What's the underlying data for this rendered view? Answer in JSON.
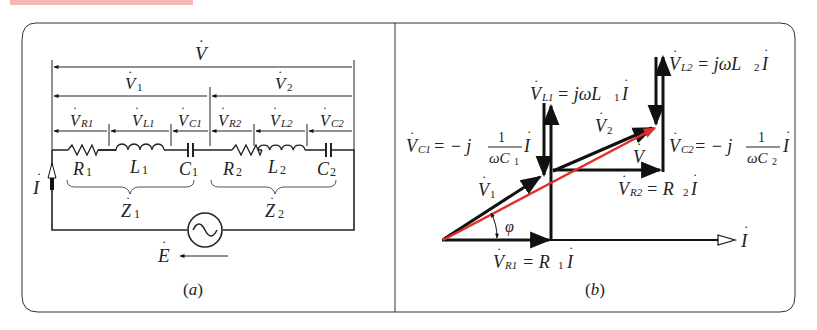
{
  "header_bar": {
    "color": "#f4b8b8"
  },
  "panel_a": {
    "caption": "（a）",
    "caption_letter": "a",
    "labels": {
      "V": "V",
      "V1": "V",
      "V1_sub": "1",
      "V2": "V",
      "V2_sub": "2",
      "VR1": "V",
      "VR1_sub": "R1",
      "VL1": "V",
      "VL1_sub": "L1",
      "VC1": "V",
      "VC1_sub": "C1",
      "VR2": "V",
      "VR2_sub": "R2",
      "VL2": "V",
      "VL2_sub": "L2",
      "VC2": "V",
      "VC2_sub": "C2",
      "R1": "R",
      "R1_sub": "1",
      "L1": "L",
      "L1_sub": "1",
      "C1": "C",
      "C1_sub": "1",
      "R2": "R",
      "R2_sub": "2",
      "L2": "L",
      "L2_sub": "2",
      "C2": "C",
      "C2_sub": "2",
      "Z1": "Z",
      "Z1_sub": "1",
      "Z2": "Z",
      "Z2_sub": "2",
      "I": "I",
      "E": "E"
    }
  },
  "panel_b": {
    "caption": "（b）",
    "caption_letter": "b",
    "labels": {
      "VL2_eq": "= jωL",
      "VL2_name": "V",
      "VL2_sub": "L2",
      "VL2_L_sub": "2",
      "VL2_I": "I",
      "VL1_name": "V",
      "VL1_sub": "L1",
      "VL1_eq": "= jωL",
      "VL1_L_sub": "1",
      "VL1_I": "I",
      "VC1_name": "V",
      "VC1_sub": "C1",
      "VC1_eq": "= − j",
      "VC1_num": "1",
      "VC1_den": "ωC",
      "VC1_den_sub": "1",
      "VC1_I": "I",
      "VC2_name": "V",
      "VC2_sub": "C2",
      "VC2_eq": "= − j",
      "VC2_num": "1",
      "VC2_den": "ωC",
      "VC2_den_sub": "2",
      "VC2_I": "I",
      "V2": "V",
      "V2_sub": "2",
      "V": "V",
      "V1": "V",
      "V1_sub": "1",
      "VR2_name": "V",
      "VR2_sub": "R2",
      "VR2_eq": "= R",
      "VR2_R_sub": "2",
      "VR2_I": "I",
      "VR1_name": "V",
      "VR1_sub": "R1",
      "VR1_eq": "= R",
      "VR1_R_sub": "1",
      "VR1_I": "I",
      "phi": "φ",
      "I": "I"
    },
    "colors": {
      "resultant": "#e0302a",
      "phasor": "#111111"
    }
  }
}
